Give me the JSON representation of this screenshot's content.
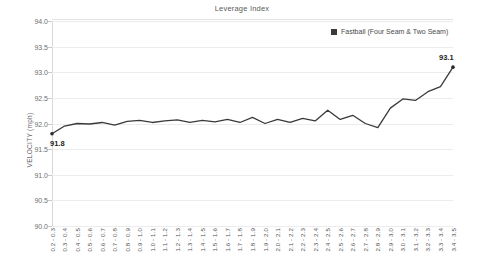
{
  "chart_data": {
    "type": "line",
    "title": "Leverage Index",
    "xlabel": "",
    "ylabel": "VELOCITY (mph)",
    "ylim": [
      90.0,
      94.0
    ],
    "ytick_labels": [
      "94.0",
      "93.5",
      "93.0",
      "92.5",
      "92.0",
      "91.5",
      "91.0",
      "90.5",
      "90.0"
    ],
    "ytick_values": [
      94.0,
      93.5,
      93.0,
      92.5,
      92.0,
      91.5,
      91.0,
      90.5,
      90.0
    ],
    "grid": true,
    "legend_position": "top-right",
    "categories": [
      "0.2 - 0.3",
      "0.3 - 0.4",
      "0.4 - 0.5",
      "0.5 - 0.6",
      "0.6 - 0.7",
      "0.7 - 0.8",
      "0.8 - 0.9",
      "0.9 - 1.0",
      "1.0 - 1.1",
      "1.1 - 1.2",
      "1.2 - 1.3",
      "1.3 - 1.4",
      "1.4 - 1.5",
      "1.5 - 1.6",
      "1.6 - 1.7",
      "1.7 - 1.8",
      "1.8 - 1.9",
      "1.9 - 2.0",
      "2.0 - 2.1",
      "2.1 - 2.2",
      "2.2 - 2.3",
      "2.3 - 2.4",
      "2.4 - 2.5",
      "2.5 - 2.6",
      "2.6 - 2.7",
      "2.7 - 2.8",
      "2.8 - 2.9",
      "2.9 - 3.0",
      "3.0 - 3.1",
      "3.1 - 3.2",
      "3.2 - 3.3",
      "3.3 - 3.4",
      "3.4 - 3.5"
    ],
    "series": [
      {
        "name": "Fastball (Four Seam & Two Seam)",
        "color": "#3a3a3a",
        "values": [
          91.8,
          91.95,
          92.0,
          91.99,
          92.02,
          91.97,
          92.04,
          92.06,
          92.02,
          92.05,
          92.07,
          92.02,
          92.06,
          92.03,
          92.08,
          92.02,
          92.12,
          92.0,
          92.08,
          92.02,
          92.1,
          92.05,
          92.26,
          92.08,
          92.16,
          92.0,
          91.92,
          92.3,
          92.48,
          92.45,
          92.62,
          92.72,
          93.1
        ]
      }
    ],
    "point_labels": [
      {
        "index": 0,
        "text": "91.8"
      },
      {
        "index": 32,
        "text": "93.1"
      }
    ]
  },
  "legend": {
    "entries": [
      {
        "label": "Fastball (Four Seam & Two Seam)",
        "color": "#3a3a3a",
        "marker": "square-marker"
      }
    ]
  }
}
